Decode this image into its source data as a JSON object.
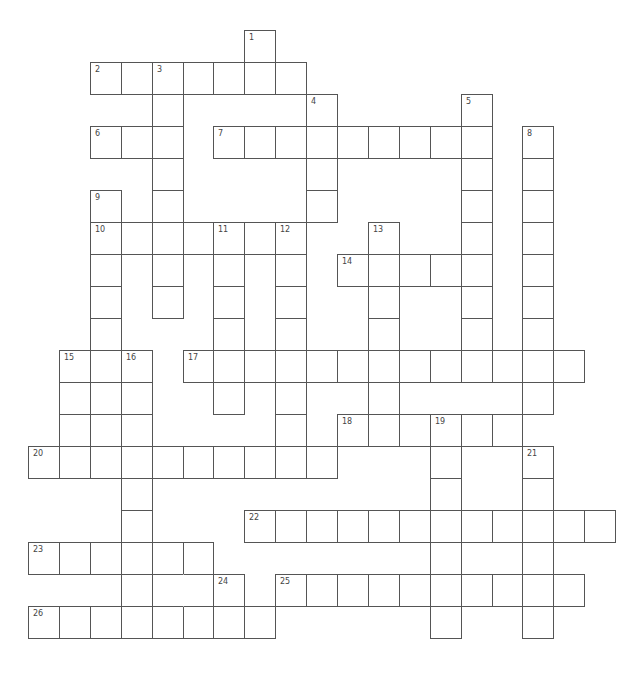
{
  "puzzle": {
    "title": "Crossword puzzle grid",
    "grid": {
      "origin_x": 28,
      "origin_y": 30,
      "cell_w": 30.9,
      "cell_h": 32,
      "line_color": "#555555"
    },
    "entries": [
      {
        "num": "1",
        "dir": "down",
        "row": 0,
        "col": 7,
        "len": 2
      },
      {
        "num": "2",
        "dir": "across",
        "row": 1,
        "col": 2,
        "len": 7
      },
      {
        "num": "3",
        "dir": "down",
        "row": 1,
        "col": 4,
        "len": 8
      },
      {
        "num": "4",
        "dir": "down",
        "row": 2,
        "col": 9,
        "len": 4
      },
      {
        "num": "5",
        "dir": "down",
        "row": 2,
        "col": 14,
        "len": 9
      },
      {
        "num": "6",
        "dir": "across",
        "row": 3,
        "col": 2,
        "len": 3
      },
      {
        "num": "7",
        "dir": "across",
        "row": 3,
        "col": 6,
        "len": 9
      },
      {
        "num": "8",
        "dir": "down",
        "row": 3,
        "col": 16,
        "len": 9
      },
      {
        "num": "9",
        "dir": "down",
        "row": 5,
        "col": 2,
        "len": 9
      },
      {
        "num": "10",
        "dir": "across",
        "row": 6,
        "col": 2,
        "len": 7
      },
      {
        "num": "11",
        "dir": "down",
        "row": 6,
        "col": 6,
        "len": 6
      },
      {
        "num": "12",
        "dir": "down",
        "row": 6,
        "col": 8,
        "len": 8
      },
      {
        "num": "13",
        "dir": "down",
        "row": 6,
        "col": 11,
        "len": 7
      },
      {
        "num": "14",
        "dir": "across",
        "row": 7,
        "col": 10,
        "len": 5
      },
      {
        "num": "15",
        "dir": "down",
        "row": 10,
        "col": 1,
        "len": 4
      },
      {
        "num": "16",
        "dir": "down",
        "row": 10,
        "col": 3,
        "len": 8
      },
      {
        "num": "17",
        "dir": "across",
        "row": 10,
        "col": 5,
        "len": 13
      },
      {
        "num": "18",
        "dir": "across",
        "row": 12,
        "col": 10,
        "len": 6
      },
      {
        "num": "19",
        "dir": "down",
        "row": 12,
        "col": 13,
        "len": 7
      },
      {
        "num": "20",
        "dir": "across",
        "row": 13,
        "col": 0,
        "len": 10
      },
      {
        "num": "21",
        "dir": "down",
        "row": 13,
        "col": 16,
        "len": 6
      },
      {
        "num": "22",
        "dir": "across",
        "row": 15,
        "col": 7,
        "len": 12
      },
      {
        "num": "23",
        "dir": "across",
        "row": 16,
        "col": 0,
        "len": 6
      },
      {
        "num": "24",
        "dir": "down",
        "row": 17,
        "col": 6,
        "len": 2
      },
      {
        "num": "25",
        "dir": "across",
        "row": 17,
        "col": 8,
        "len": 10
      },
      {
        "num": "26",
        "dir": "across",
        "row": 18,
        "col": 0,
        "len": 8
      }
    ],
    "extra_cells": [
      {
        "row": 17,
        "col": 4
      },
      {
        "row": 17,
        "col": 5,
        "no_left_border": true
      }
    ]
  }
}
